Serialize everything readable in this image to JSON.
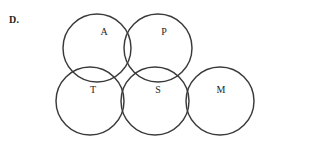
{
  "figure": {
    "item_label": "D.",
    "background_color": "#ffffff",
    "stroke_color": "#3a3a3c",
    "text_color": "#231f20",
    "width": 312,
    "height": 146
  },
  "chart_data": {
    "type": "diagram",
    "subtype": "venn-circle-cluster",
    "title": "",
    "xlabel": "",
    "ylabel": "",
    "grid": false,
    "legend": false,
    "circle_count": 5,
    "radius": 34,
    "circles": [
      {
        "label": "A",
        "cx": 97,
        "cy": 48,
        "r": 34,
        "row": "top",
        "label_x": 104,
        "label_y": 33
      },
      {
        "label": "P",
        "cx": 158,
        "cy": 48,
        "r": 34,
        "row": "top",
        "label_x": 164,
        "label_y": 33
      },
      {
        "label": "T",
        "cx": 90,
        "cy": 101,
        "r": 34,
        "row": "bottom",
        "label_x": 93,
        "label_y": 91
      },
      {
        "label": "S",
        "cx": 155,
        "cy": 101,
        "r": 34,
        "row": "bottom",
        "label_x": 158,
        "label_y": 91
      },
      {
        "label": "M",
        "cx": 220,
        "cy": 101,
        "r": 34,
        "row": "bottom",
        "label_x": 221,
        "label_y": 91
      }
    ],
    "overlaps": [
      [
        "A",
        "P"
      ],
      [
        "A",
        "T"
      ],
      [
        "A",
        "S"
      ],
      [
        "P",
        "S"
      ],
      [
        "T",
        "S"
      ],
      [
        "S",
        "M"
      ]
    ]
  }
}
